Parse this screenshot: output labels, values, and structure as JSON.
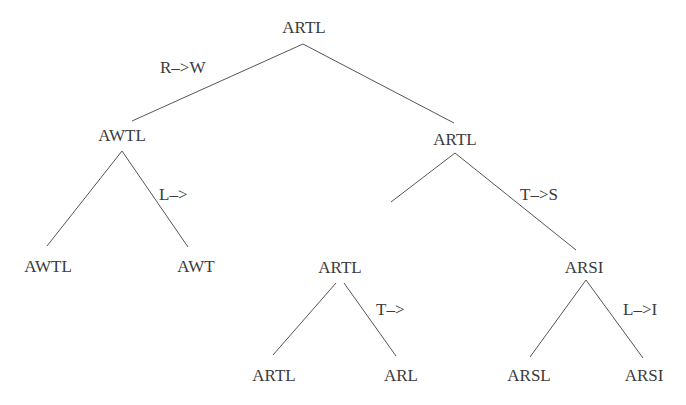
{
  "diagram": {
    "type": "tree",
    "line_color": "#555555",
    "text_color": "#3a3a3a",
    "nodes": [
      {
        "id": "root",
        "label": "ARTL",
        "x": 304,
        "y": 18
      },
      {
        "id": "l1_left",
        "label": "AWTL",
        "x": 122,
        "y": 126
      },
      {
        "id": "l1_right",
        "label": "ARTL",
        "x": 455,
        "y": 130
      },
      {
        "id": "l2_ll",
        "label": "AWTL",
        "x": 48,
        "y": 257
      },
      {
        "id": "l2_lr",
        "label": "AWT",
        "x": 196,
        "y": 257
      },
      {
        "id": "l2_rl",
        "label": "ARTL",
        "x": 340,
        "y": 258
      },
      {
        "id": "l2_rr",
        "label": "ARSI",
        "x": 584,
        "y": 258
      },
      {
        "id": "l3_a",
        "label": "ARTL",
        "x": 274,
        "y": 366
      },
      {
        "id": "l3_b",
        "label": "ARL",
        "x": 401,
        "y": 366
      },
      {
        "id": "l3_c",
        "label": "ARSL",
        "x": 529,
        "y": 366
      },
      {
        "id": "l3_d",
        "label": "ARSI",
        "x": 644,
        "y": 366
      }
    ],
    "edges": [
      {
        "from": "root",
        "to": "l1_left",
        "x1": 303,
        "y1": 44,
        "x2": 132,
        "y2": 121
      },
      {
        "from": "root",
        "to": "l1_right",
        "x1": 303,
        "y1": 44,
        "x2": 454,
        "y2": 123
      },
      {
        "from": "l1_left",
        "to": "l2_ll",
        "x1": 122,
        "y1": 151,
        "x2": 47,
        "y2": 246
      },
      {
        "from": "l1_left",
        "to": "l2_lr",
        "x1": 122,
        "y1": 151,
        "x2": 188,
        "y2": 247
      },
      {
        "from": "l1_right",
        "to": "l2_rl",
        "x1": 455,
        "y1": 153,
        "x2": 391,
        "y2": 202
      },
      {
        "from": "l1_right",
        "to": "l2_rr",
        "x1": 455,
        "y1": 153,
        "x2": 576,
        "y2": 250
      },
      {
        "from": "l2_rl",
        "to": "l3_a",
        "x1": 336,
        "y1": 283,
        "x2": 273,
        "y2": 355
      },
      {
        "from": "l2_rl",
        "to": "l3_b",
        "x1": 344,
        "y1": 283,
        "x2": 396,
        "y2": 356
      },
      {
        "from": "l2_rr",
        "to": "l3_c",
        "x1": 586,
        "y1": 280,
        "x2": 530,
        "y2": 357
      },
      {
        "from": "l2_rr",
        "to": "l3_d",
        "x1": 586,
        "y1": 280,
        "x2": 643,
        "y2": 358
      }
    ],
    "edge_labels": [
      {
        "text": "R–>W",
        "x": 160,
        "y": 58
      },
      {
        "text": "L–>",
        "x": 159,
        "y": 185
      },
      {
        "text": "T–>S",
        "x": 520,
        "y": 185
      },
      {
        "text": "T–>",
        "x": 376,
        "y": 300
      },
      {
        "text": "L–>I",
        "x": 623,
        "y": 300
      }
    ]
  }
}
